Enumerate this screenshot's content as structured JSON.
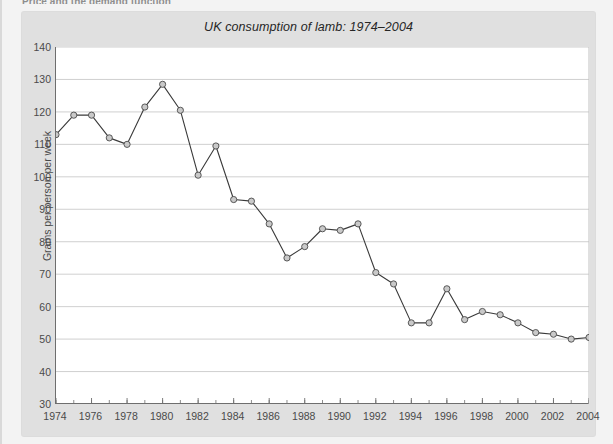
{
  "page": {
    "heading": "Price and the demand function",
    "background_color": "#f3f3f3",
    "figure_background_color": "#e0e0e0",
    "plot_background_color": "#ffffff"
  },
  "figure": {
    "title": "UK consumption of lamb: 1974–2004"
  },
  "chart_data": {
    "type": "line",
    "title": "UK consumption of lamb: 1974–2004",
    "xlabel": "",
    "ylabel": "Grams per person per week",
    "xlim": [
      1974,
      2004
    ],
    "ylim": [
      30,
      140
    ],
    "ytick_step": 10,
    "xtick_step": 2,
    "xtick_minor_step": 1,
    "grid": "horizontal",
    "legend": "none",
    "marker": "circle",
    "marker_fill": "#c9c9c9",
    "line_color": "#3a3a3a",
    "yticks": [
      30,
      40,
      50,
      60,
      70,
      80,
      90,
      100,
      110,
      120,
      130,
      140
    ],
    "xticks": [
      1974,
      1976,
      1978,
      1980,
      1982,
      1984,
      1986,
      1988,
      1990,
      1992,
      1994,
      1996,
      1998,
      2000,
      2002,
      2004
    ],
    "x": [
      1974,
      1975,
      1976,
      1977,
      1978,
      1979,
      1980,
      1981,
      1982,
      1983,
      1984,
      1985,
      1986,
      1987,
      1988,
      1989,
      1990,
      1991,
      1992,
      1993,
      1994,
      1995,
      1996,
      1997,
      1998,
      1999,
      2000,
      2001,
      2002,
      2003,
      2004
    ],
    "values": [
      113,
      119,
      119,
      112,
      110,
      121.5,
      128.5,
      120.5,
      100.5,
      109.5,
      93,
      92.5,
      85.5,
      75,
      78.5,
      84,
      83.5,
      85.5,
      70.5,
      67,
      55,
      55,
      65.5,
      56,
      58.5,
      57.5,
      55,
      52,
      51.5,
      50,
      50.5
    ]
  }
}
